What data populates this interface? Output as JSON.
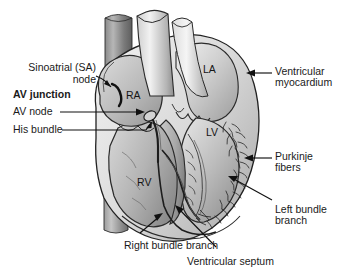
{
  "figure": {
    "type": "anatomical-illustration",
    "background_color": "#ffffff",
    "ink_color": "#1a1a1a"
  },
  "chamber_labels": {
    "right_atrium": "RA",
    "left_atrium": "LA",
    "left_ventricle": "LV",
    "right_ventricle": "RV"
  },
  "annotations": {
    "sinoatrial_node_line1": "Sinoatrial (SA)",
    "sinoatrial_node_line2": "node",
    "av_junction": "AV junction",
    "av_node": "AV node",
    "his_bundle": "His bundle",
    "ventricular_myocardium_line1": "Ventricular",
    "ventricular_myocardium_line2": "myocardium",
    "purkinje_fibers_line1": "Purkinje",
    "purkinje_fibers_line2": "fibers",
    "left_bundle_branch_line1": "Left bundle",
    "left_bundle_branch_line2": "branch",
    "right_bundle_branch": "Right bundle branch",
    "ventricular_septum": "Ventricular septum"
  },
  "palette": {
    "tissue_light": "#e9e9e9",
    "tissue_mid": "#c9c9c9",
    "tissue_dark": "#9a9a9a",
    "tissue_darker": "#7a7a7a",
    "vessel_dark": "#6f6f6f",
    "outline": "#222222"
  }
}
